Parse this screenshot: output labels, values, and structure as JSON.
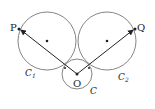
{
  "diagram": {
    "type": "geometry",
    "circles": [
      {
        "name": "C1",
        "label": "C",
        "subscript": "1",
        "cx": 47,
        "cy": 41,
        "r": 29
      },
      {
        "name": "C2",
        "label": "C",
        "subscript": "2",
        "cx": 107,
        "cy": 41,
        "r": 29
      },
      {
        "name": "C",
        "label": "C",
        "cx": 77,
        "cy": 74,
        "r": 15
      }
    ],
    "points": {
      "P": {
        "label": "P",
        "x": 19,
        "y": 29
      },
      "Q": {
        "label": "Q",
        "x": 135,
        "y": 29
      },
      "O": {
        "label": "O",
        "x": 77,
        "y": 74
      }
    },
    "vectors": [
      {
        "from": "O",
        "to": "P"
      },
      {
        "from": "O",
        "to": "Q"
      }
    ],
    "center_dots": [
      {
        "x": 47,
        "y": 41
      },
      {
        "x": 107,
        "y": 41
      }
    ],
    "colors": {
      "stroke": "#666666",
      "ink": "#222222"
    }
  }
}
